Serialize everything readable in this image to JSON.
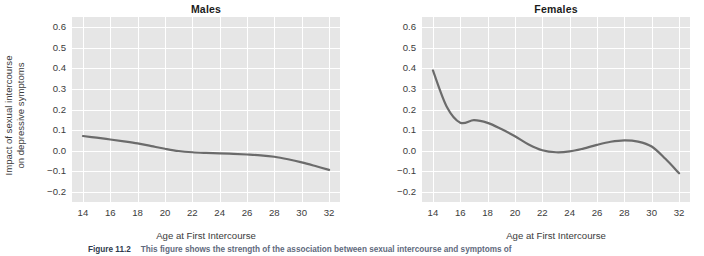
{
  "figure": {
    "caption_number": "Figure 11.2",
    "caption_text": "This figure shows the strength of the association between sexual intercourse and symptoms of",
    "panel_bg_color": "#e6e6e6",
    "gridline_color": "#ffffff",
    "curve_color": "#6b6b6b",
    "ylabel_line1": "Impact of sexual intercourse",
    "ylabel_line2": "on depressive symptoms",
    "ylabel": "Impact of sexual intercourse on depressive symptoms",
    "xlabel": "Age at First Intercourse"
  },
  "chart_data": [
    {
      "type": "line",
      "title": "Males",
      "xlabel": "Age at First Intercourse",
      "ylabel": "Impact of sexual intercourse on depressive symptoms",
      "xlim": [
        13.2,
        32.8
      ],
      "ylim": [
        -0.25,
        0.65
      ],
      "xticks": [
        14,
        16,
        18,
        20,
        22,
        24,
        26,
        28,
        30,
        32
      ],
      "xtick_labels": [
        "14",
        "16",
        "18",
        "20",
        "22",
        "24",
        "26",
        "28",
        "30",
        "32"
      ],
      "yticks": [
        0.6,
        0.5,
        0.4,
        0.3,
        0.2,
        0.1,
        0.0,
        -0.1,
        -0.2
      ],
      "ytick_labels": [
        "0.6",
        "0.5",
        "0.4",
        "0.3",
        "0.2",
        "0.1",
        "0.0",
        "−0.1",
        "−0.2"
      ],
      "grid": true,
      "legend": "none",
      "x": [
        14,
        15,
        16,
        17,
        18,
        19,
        20,
        21,
        22,
        23,
        24,
        25,
        26,
        27,
        28,
        29,
        30,
        31,
        32
      ],
      "values": [
        0.071,
        0.063,
        0.054,
        0.045,
        0.035,
        0.022,
        0.009,
        -0.002,
        -0.008,
        -0.011,
        -0.013,
        -0.016,
        -0.019,
        -0.023,
        -0.03,
        -0.042,
        -0.057,
        -0.075,
        -0.094
      ]
    },
    {
      "type": "line",
      "title": "Females",
      "xlabel": "Age at First Intercourse",
      "ylabel": "Impact of sexual intercourse on depressive symptoms",
      "xlim": [
        13.2,
        32.8
      ],
      "ylim": [
        -0.25,
        0.65
      ],
      "xticks": [
        14,
        16,
        18,
        20,
        22,
        24,
        26,
        28,
        30,
        32
      ],
      "xtick_labels": [
        "14",
        "16",
        "18",
        "20",
        "22",
        "24",
        "26",
        "28",
        "30",
        "32"
      ],
      "yticks": [
        0.6,
        0.5,
        0.4,
        0.3,
        0.2,
        0.1,
        0.0,
        -0.1,
        -0.2
      ],
      "ytick_labels": [
        "0.6",
        "0.5",
        "0.4",
        "0.3",
        "0.2",
        "0.1",
        "0.0",
        "−0.1",
        "−0.2"
      ],
      "grid": true,
      "legend": "none",
      "x": [
        14,
        15,
        16,
        17,
        18,
        19,
        20,
        21,
        22,
        23,
        24,
        25,
        26,
        27,
        28,
        29,
        30,
        31,
        32
      ],
      "values": [
        0.39,
        0.215,
        0.136,
        0.148,
        0.135,
        0.105,
        0.07,
        0.03,
        0.002,
        -0.008,
        -0.004,
        0.01,
        0.028,
        0.043,
        0.05,
        0.044,
        0.02,
        -0.04,
        -0.11
      ]
    }
  ]
}
